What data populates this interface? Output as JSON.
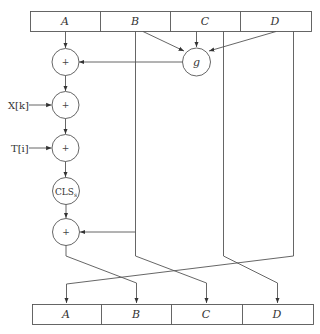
{
  "diagram": {
    "type": "block-cipher-round",
    "input_registers": [
      "A",
      "B",
      "C",
      "D"
    ],
    "output_registers": [
      "A",
      "B",
      "C",
      "D"
    ],
    "nodes": {
      "add1": "+",
      "g_function": "g",
      "add_x": "+",
      "add_t": "+",
      "cls": "CLS",
      "cls_sub": "s",
      "add_final": "+"
    },
    "inputs": {
      "x": "X[k]",
      "t": "T[i]"
    },
    "colors": {
      "line": "#555555",
      "text": "#333333",
      "background": "#ffffff"
    }
  }
}
